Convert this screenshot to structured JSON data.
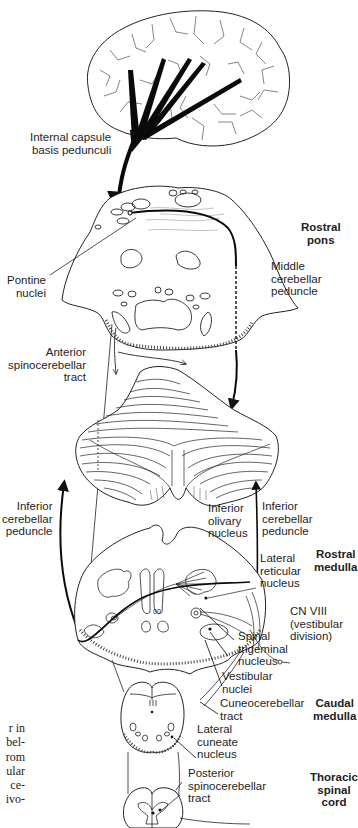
{
  "figure": {
    "structures": [
      "cerebral-cortex",
      "rostral-pons-section",
      "cerebellum",
      "rostral-medulla-section",
      "caudal-medulla-section",
      "thoracic-spinal-cord-section"
    ]
  },
  "labels": {
    "internal_capsule": "Internal capsule\nbasis pedunculi",
    "pontine_nuclei": "Pontine\nnuclei",
    "middle_cerebellar_peduncle": "Middle\ncerebellar\npeduncle",
    "anterior_spinocerebellar_tract": "Anterior\nspinocerebellar\ntract",
    "inferior_cerebellar_peduncle_left": "Inferior\ncerebellar\npeduncle",
    "inferior_cerebellar_peduncle_right": "Inferior\ncerebellar\npeduncle",
    "inferior_olivary_nucleus": "Inferior\nolivary\nnucleus",
    "lateral_reticular_nucleus": "Lateral\nreticular\nnucleus",
    "cn_viii": "CN VIII\n(vestibular\ndivision)",
    "spinal_trigeminal_nucleus": "Spinal\ntrigeminal\nnucleus",
    "vestibular_nuclei": "Vestibular\nnuclei",
    "cuneocerebellar_tract": "Cuneocerebellar\ntract",
    "lateral_cuneate_nucleus": "Lateral\ncuneate\nnucleus",
    "posterior_spinocerebellar_tract": "Posterior\nspinocerebellar\ntract"
  },
  "levels": {
    "rostral_pons": "Rostral\npons",
    "rostral_medulla": "Rostral\nmedulla",
    "caudal_medulla": "Caudal\nmedulla",
    "thoracic_spinal_cord": "Thoracic\nspinal\ncord"
  },
  "adjacent_text_fragment": "r in\nbel-\nrom\nular\n ce-\nivo-"
}
